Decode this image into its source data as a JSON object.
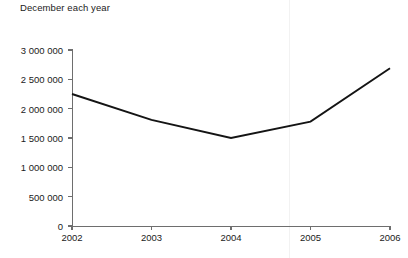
{
  "chart_data": {
    "type": "line",
    "title": "December each year",
    "xlabel": "",
    "ylabel": "",
    "categories": [
      "2002",
      "2003",
      "2004",
      "2005",
      "2006"
    ],
    "values": [
      2250000,
      1810000,
      1500000,
      1780000,
      2690000
    ],
    "series": [
      {
        "name": "December each year",
        "values": [
          2250000,
          1810000,
          1500000,
          1780000,
          2690000
        ]
      }
    ],
    "ylim": [
      0,
      3000000
    ],
    "yticks": [
      0,
      500000,
      1000000,
      1500000,
      2000000,
      2500000,
      3000000
    ],
    "ytick_labels": [
      "0",
      "500 000",
      "1 000 000",
      "1 500 000",
      "2 000 000",
      "2 500 000",
      "3 000 000"
    ],
    "xtick_labels": [
      "2002",
      "2003",
      "2004",
      "2005",
      "2006"
    ],
    "grid": false,
    "legend": false,
    "line_color": "#141414",
    "axis_color": "#6e6e6e"
  },
  "artifacts": {
    "clipped_bottom_text": "",
    "scan_line_color": "#f2f2f2"
  }
}
